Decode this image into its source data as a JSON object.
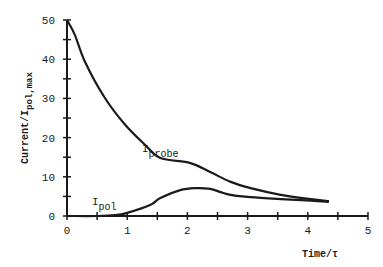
{
  "chart_data": {
    "type": "line",
    "title": "",
    "xlabel": "Time/τ",
    "ylabel": "Current/I",
    "ylabel_subscript": "pol, max",
    "xlim": [
      0,
      5
    ],
    "ylim": [
      0,
      50
    ],
    "x_ticks": [
      0,
      1,
      2,
      3,
      4,
      5
    ],
    "x_minor_ticks": [
      0.5,
      1.5,
      2.5,
      3.5,
      4.5
    ],
    "y_ticks": [
      0,
      10,
      20,
      30,
      40,
      50
    ],
    "y_minor_ticks": [
      5,
      15,
      25,
      35,
      45
    ],
    "grid": false,
    "legend": "inline labels",
    "series": [
      {
        "name": "I_probe",
        "label_main": "I",
        "label_sub": "probe",
        "x": [
          0,
          0.13,
          0.3,
          0.63,
          0.97,
          1.3,
          1.55,
          2.05,
          2.38,
          2.72,
          3.05,
          3.55,
          4.05,
          4.35
        ],
        "values": [
          50,
          46.2,
          39.3,
          30.1,
          23.2,
          18.1,
          14.8,
          13.5,
          11.2,
          8.7,
          7.1,
          5.4,
          4.3,
          3.8
        ]
      },
      {
        "name": "I_pol",
        "label_main": "I",
        "label_sub": "pol",
        "x": [
          0,
          0.5,
          0.8,
          1.0,
          1.38,
          1.55,
          1.88,
          2.13,
          2.38,
          2.55,
          2.72,
          3.05,
          3.55,
          4.05,
          4.35
        ],
        "values": [
          0,
          0,
          0.2,
          0.8,
          2.8,
          4.6,
          6.6,
          7.1,
          6.9,
          6.1,
          5.4,
          4.8,
          4.3,
          3.9,
          3.6
        ]
      }
    ]
  },
  "labels": {
    "xlabel": "Time/τ",
    "ylabel_main": "Current/I",
    "ylabel_sub": "pol,max",
    "probe_main": "I",
    "probe_sub": "probe",
    "pol_main": "I",
    "pol_sub": "pol"
  }
}
